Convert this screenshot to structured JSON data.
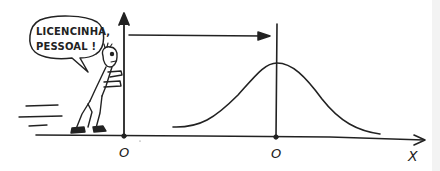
{
  "speech_bubble": {
    "line1": "LICENCINHA,",
    "line2": "PESSOAL !"
  },
  "axes": {
    "origin_label": "O",
    "shifted_origin_label": "O",
    "x_axis_label": "X"
  },
  "colors": {
    "ink": "#222222",
    "background": "#ffffff"
  },
  "illustration": {
    "description": "Cartoon character pushing vertical axis; arrow indicates shift of origin to the mean of a bell-shaped curve"
  }
}
